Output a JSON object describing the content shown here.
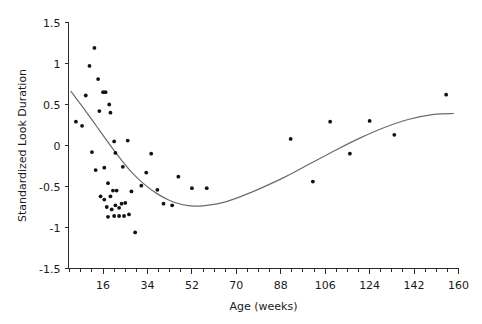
{
  "chart_data": {
    "type": "scatter",
    "title": "",
    "xlabel": "Age (weeks)",
    "ylabel": "Standardized Look Duration",
    "xlim": [
      2,
      160
    ],
    "ylim": [
      -1.5,
      1.5
    ],
    "grid": false,
    "legend": null,
    "xticks": [
      16,
      34,
      52,
      70,
      88,
      106,
      124,
      142,
      160
    ],
    "xtick_labels": [
      "16",
      "34",
      "52",
      "70",
      "88",
      "106",
      "124",
      "142",
      "160"
    ],
    "xminor_step": 4.5,
    "yticks": [
      -1.5,
      -1,
      -0.5,
      0,
      0.5,
      1,
      1.5
    ],
    "ytick_labels": [
      "-1.5",
      "-1",
      "-0.5",
      "0",
      "0.5",
      "1",
      "1.5"
    ],
    "point_color": "#111111",
    "curve_color": "#6b6b6b",
    "axis_color": "#2b2b2b",
    "points": [
      {
        "x": 5.0,
        "y": 0.29
      },
      {
        "x": 7.5,
        "y": 0.24
      },
      {
        "x": 9.0,
        "y": 0.61
      },
      {
        "x": 10.5,
        "y": 0.97
      },
      {
        "x": 12.5,
        "y": 1.19
      },
      {
        "x": 11.5,
        "y": -0.08
      },
      {
        "x": 14.0,
        "y": 0.81
      },
      {
        "x": 14.5,
        "y": 0.42
      },
      {
        "x": 13.0,
        "y": -0.3
      },
      {
        "x": 16.0,
        "y": 0.65
      },
      {
        "x": 17.0,
        "y": 0.65
      },
      {
        "x": 16.5,
        "y": -0.27
      },
      {
        "x": 18.5,
        "y": 0.5
      },
      {
        "x": 19.0,
        "y": 0.4
      },
      {
        "x": 18.0,
        "y": -0.46
      },
      {
        "x": 20.5,
        "y": 0.05
      },
      {
        "x": 21.0,
        "y": -0.09
      },
      {
        "x": 15.0,
        "y": -0.62
      },
      {
        "x": 16.5,
        "y": -0.66
      },
      {
        "x": 19.0,
        "y": -0.62
      },
      {
        "x": 20.0,
        "y": -0.55
      },
      {
        "x": 21.5,
        "y": -0.55
      },
      {
        "x": 17.5,
        "y": -0.75
      },
      {
        "x": 19.5,
        "y": -0.78
      },
      {
        "x": 21.0,
        "y": -0.73
      },
      {
        "x": 22.5,
        "y": -0.76
      },
      {
        "x": 23.5,
        "y": -0.71
      },
      {
        "x": 18.0,
        "y": -0.87
      },
      {
        "x": 20.5,
        "y": -0.86
      },
      {
        "x": 22.5,
        "y": -0.86
      },
      {
        "x": 24.5,
        "y": -0.86
      },
      {
        "x": 26.5,
        "y": -0.84
      },
      {
        "x": 25.0,
        "y": -0.7
      },
      {
        "x": 27.5,
        "y": -0.56
      },
      {
        "x": 24.0,
        "y": -0.26
      },
      {
        "x": 26.0,
        "y": 0.06
      },
      {
        "x": 29.0,
        "y": -1.06
      },
      {
        "x": 31.5,
        "y": -0.49
      },
      {
        "x": 33.5,
        "y": -0.33
      },
      {
        "x": 35.5,
        "y": -0.1
      },
      {
        "x": 38.0,
        "y": -0.54
      },
      {
        "x": 40.5,
        "y": -0.71
      },
      {
        "x": 44.0,
        "y": -0.73
      },
      {
        "x": 46.5,
        "y": -0.38
      },
      {
        "x": 52.0,
        "y": -0.52
      },
      {
        "x": 58.0,
        "y": -0.52
      },
      {
        "x": 92.0,
        "y": 0.08
      },
      {
        "x": 101.0,
        "y": -0.44
      },
      {
        "x": 108.0,
        "y": 0.29
      },
      {
        "x": 116.0,
        "y": -0.1
      },
      {
        "x": 124.0,
        "y": 0.3
      },
      {
        "x": 134.0,
        "y": 0.13
      },
      {
        "x": 155.0,
        "y": 0.62
      }
    ],
    "fit_curve": {
      "description": "smoothed regression line",
      "points": [
        {
          "x": 3.0,
          "y": 0.66
        },
        {
          "x": 8.0,
          "y": 0.46
        },
        {
          "x": 13.0,
          "y": 0.25
        },
        {
          "x": 18.0,
          "y": 0.04
        },
        {
          "x": 23.0,
          "y": -0.16
        },
        {
          "x": 28.0,
          "y": -0.34
        },
        {
          "x": 33.0,
          "y": -0.48
        },
        {
          "x": 38.0,
          "y": -0.59
        },
        {
          "x": 43.0,
          "y": -0.67
        },
        {
          "x": 48.0,
          "y": -0.72
        },
        {
          "x": 53.0,
          "y": -0.74
        },
        {
          "x": 58.0,
          "y": -0.73
        },
        {
          "x": 64.0,
          "y": -0.7
        },
        {
          "x": 72.0,
          "y": -0.62
        },
        {
          "x": 80.0,
          "y": -0.52
        },
        {
          "x": 90.0,
          "y": -0.38
        },
        {
          "x": 100.0,
          "y": -0.22
        },
        {
          "x": 110.0,
          "y": -0.06
        },
        {
          "x": 120.0,
          "y": 0.09
        },
        {
          "x": 130.0,
          "y": 0.22
        },
        {
          "x": 140.0,
          "y": 0.32
        },
        {
          "x": 150.0,
          "y": 0.38
        },
        {
          "x": 158.0,
          "y": 0.39
        }
      ]
    }
  }
}
